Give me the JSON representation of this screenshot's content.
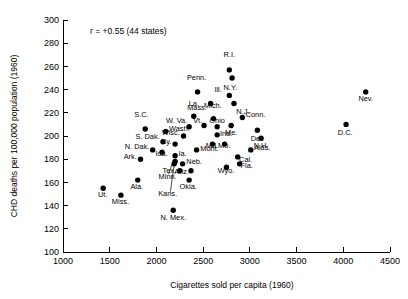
{
  "chart_data": {
    "type": "scatter",
    "title": "",
    "xlabel": "Cigarettes sold per capita (1960)",
    "ylabel": "CHD deaths per 100,000 population (1960)",
    "xlim": [
      1000,
      4500
    ],
    "ylim": [
      100,
      300
    ],
    "xticks": [
      1000,
      1500,
      2000,
      2500,
      3000,
      3500,
      4000,
      4500
    ],
    "yticks": [
      100,
      120,
      140,
      160,
      180,
      200,
      220,
      240,
      260,
      280,
      300
    ],
    "grid": false,
    "legend": null,
    "annotations": [
      {
        "text": "r = +0.55 (44 states)",
        "x": 1290,
        "y": 288
      }
    ],
    "point_count": 44,
    "points": [
      {
        "label": "R.I.",
        "x": 2780,
        "y": 257,
        "lx": 2780,
        "ly": 268,
        "anchor": "middle"
      },
      {
        "label": "N.Y.",
        "x": 2810,
        "y": 250,
        "lx": 2790,
        "ly": 240,
        "anchor": "middle"
      },
      {
        "label": "Ill.",
        "x": 2780,
        "y": 235,
        "lx": 2700,
        "ly": 238,
        "anchor": "end"
      },
      {
        "label": "N.J.",
        "x": 2830,
        "y": 228,
        "lx": 2855,
        "ly": 219,
        "anchor": "start"
      },
      {
        "label": "Penn.",
        "x": 2440,
        "y": 238,
        "lx": 2430,
        "ly": 248,
        "anchor": "middle"
      },
      {
        "label": "Mass.",
        "x": 2580,
        "y": 228,
        "lx": 2540,
        "ly": 222,
        "anchor": "end"
      },
      {
        "label": "Conn.",
        "x": 2920,
        "y": 216,
        "lx": 2955,
        "ly": 216,
        "anchor": "start"
      },
      {
        "label": "Nev.",
        "x": 4240,
        "y": 238,
        "lx": 4240,
        "ly": 230,
        "anchor": "middle"
      },
      {
        "label": "D.C.",
        "x": 4030,
        "y": 210,
        "lx": 4020,
        "ly": 201,
        "anchor": "middle"
      },
      {
        "label": "Del.",
        "x": 3080,
        "y": 205,
        "lx": 3080,
        "ly": 196,
        "anchor": "middle"
      },
      {
        "label": "Me.",
        "x": 2800,
        "y": 209,
        "lx": 2800,
        "ly": 201,
        "anchor": "middle"
      },
      {
        "label": "Mich.",
        "x": 2610,
        "y": 215,
        "lx": 2605,
        "ly": 224,
        "anchor": "middle"
      },
      {
        "label": "La.",
        "x": 2400,
        "y": 217,
        "lx": 2400,
        "ly": 226,
        "anchor": "middle"
      },
      {
        "label": "Ohio",
        "x": 2650,
        "y": 208,
        "lx": 2650,
        "ly": 211,
        "anchor": "middle"
      },
      {
        "label": "S.C.",
        "x": 1880,
        "y": 206,
        "lx": 1840,
        "ly": 216,
        "anchor": "middle"
      },
      {
        "label": "Wash.",
        "x": 2100,
        "y": 204,
        "lx": 2135,
        "ly": 204,
        "anchor": "start"
      },
      {
        "label": "W. Va.",
        "x": 2350,
        "y": 208,
        "lx": 2330,
        "ly": 211,
        "anchor": "end"
      },
      {
        "label": "Vt.",
        "x": 2510,
        "y": 209,
        "lx": 2490,
        "ly": 211,
        "anchor": "end"
      },
      {
        "label": "Wisc.",
        "x": 2290,
        "y": 200,
        "lx": 2250,
        "ly": 201,
        "anchor": "end"
      },
      {
        "label": "Ind.",
        "x": 2650,
        "y": 201,
        "lx": 2680,
        "ly": 200,
        "anchor": "start"
      },
      {
        "label": "S. Dak.",
        "x": 2070,
        "y": 195,
        "lx": 2035,
        "ly": 197,
        "anchor": "end"
      },
      {
        "label": "Ky.",
        "x": 2200,
        "y": 193,
        "lx": 2160,
        "ly": 193,
        "anchor": "end"
      },
      {
        "label": "Md.",
        "x": 2600,
        "y": 193,
        "lx": 2595,
        "ly": 190,
        "anchor": "middle"
      },
      {
        "label": "Mo.",
        "x": 2730,
        "y": 193,
        "lx": 2725,
        "ly": 190,
        "anchor": "middle"
      },
      {
        "label": "N. Dak.",
        "x": 1960,
        "y": 188,
        "lx": 1925,
        "ly": 189,
        "anchor": "end"
      },
      {
        "label": "Ida.",
        "x": 2060,
        "y": 186,
        "lx": 2055,
        "ly": 183,
        "anchor": "middle"
      },
      {
        "label": "Mont.",
        "x": 2430,
        "y": 188,
        "lx": 2470,
        "ly": 187,
        "anchor": "start"
      },
      {
        "label": "Alas.",
        "x": 3010,
        "y": 188,
        "lx": 3045,
        "ly": 188,
        "anchor": "start"
      },
      {
        "label": "Ark.",
        "x": 1830,
        "y": 180,
        "lx": 1790,
        "ly": 180,
        "anchor": "end"
      },
      {
        "label": "Ia.",
        "x": 2200,
        "y": 183,
        "lx": 2235,
        "ly": 183,
        "anchor": "start"
      },
      {
        "label": "Neb.",
        "x": 2280,
        "y": 176,
        "lx": 2320,
        "ly": 176,
        "anchor": "start"
      },
      {
        "label": "Cal.",
        "x": 2870,
        "y": 182,
        "lx": 2885,
        "ly": 178,
        "anchor": "start"
      },
      {
        "label": "Minn.",
        "x": 2200,
        "y": 178,
        "lx": 2120,
        "ly": 163,
        "anchor": "middle"
      },
      {
        "label": "Tex.",
        "x": 2250,
        "y": 170,
        "lx": 2210,
        "ly": 168,
        "anchor": "end"
      },
      {
        "label": "Ariz.",
        "x": 2370,
        "y": 170,
        "lx": 2350,
        "ly": 167,
        "anchor": "end"
      },
      {
        "label": "Wyo.",
        "x": 2750,
        "y": 173,
        "lx": 2745,
        "ly": 168,
        "anchor": "middle"
      },
      {
        "label": "Fla.",
        "x": 2890,
        "y": 176,
        "lx": 2900,
        "ly": 172,
        "anchor": "start"
      },
      {
        "label": "Okla.",
        "x": 2350,
        "y": 162,
        "lx": 2340,
        "ly": 154,
        "anchor": "middle"
      },
      {
        "label": "Kans.",
        "x": 2190,
        "y": 176,
        "lx": 2120,
        "ly": 148,
        "anchor": "middle"
      },
      {
        "label": "Ala.",
        "x": 1800,
        "y": 162,
        "lx": 1790,
        "ly": 154,
        "anchor": "middle"
      },
      {
        "label": "Ut.",
        "x": 1430,
        "y": 155,
        "lx": 1425,
        "ly": 147,
        "anchor": "middle"
      },
      {
        "label": "Miss.",
        "x": 1620,
        "y": 149,
        "lx": 1615,
        "ly": 141,
        "anchor": "middle"
      },
      {
        "label": "N. Mex.",
        "x": 2180,
        "y": 136,
        "lx": 2180,
        "ly": 128,
        "anchor": "middle"
      },
      {
        "label": "N.H.",
        "x": 3120,
        "y": 198,
        "lx": 3120,
        "ly": 190,
        "anchor": "middle"
      }
    ],
    "leader_lines": [
      {
        "from_x": 2130,
        "from_y": 167,
        "to_x": 2185,
        "to_y": 180
      },
      {
        "from_x": 2150,
        "from_y": 152,
        "to_x": 2195,
        "to_y": 179
      }
    ]
  },
  "colors": {
    "background": "#ffffff",
    "foreground": "#000000",
    "point": "#000000"
  }
}
